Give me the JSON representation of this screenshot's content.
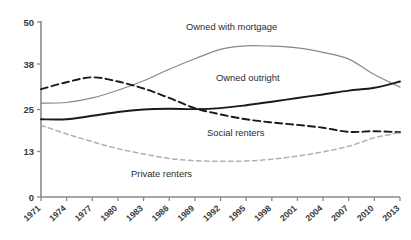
{
  "chart_data": {
    "type": "line",
    "title": "",
    "subtitle": "",
    "xlabel": "",
    "ylabel": "",
    "grid": false,
    "legend_position": "inline-annotations",
    "xlim": [
      1971,
      2013
    ],
    "ylim": [
      0,
      50
    ],
    "ytick_labels": [
      "0",
      "13",
      "25",
      "38",
      "50"
    ],
    "ytick_values": [
      0,
      13,
      25,
      38,
      50
    ],
    "xtick_labels": [
      "1971",
      "1974",
      "1977",
      "1980",
      "1983",
      "1986",
      "1989",
      "1992",
      "1995",
      "1998",
      "2001",
      "2004",
      "2007",
      "2010",
      "2013"
    ],
    "xtick_values": [
      1971,
      1974,
      1977,
      1980,
      1983,
      1986,
      1989,
      1992,
      1995,
      1998,
      2001,
      2004,
      2007,
      2010,
      2013
    ],
    "x": [
      1971,
      1974,
      1977,
      1980,
      1983,
      1986,
      1989,
      1992,
      1995,
      1998,
      2001,
      2004,
      2007,
      2010,
      2013
    ],
    "series": [
      {
        "name": "Owned with mortgage",
        "label": "Owned with mortgage",
        "color": "#888888",
        "style": "solid",
        "width": 1.2,
        "values": [
          26.8,
          27.0,
          28.3,
          30.5,
          33.2,
          36.5,
          39.5,
          42.2,
          43.2,
          43.1,
          42.6,
          41.3,
          39.4,
          35.0,
          31.4
        ]
      },
      {
        "name": "Owned outright",
        "label": "Owned outright",
        "color": "#1a1a1a",
        "style": "solid",
        "width": 1.9,
        "values": [
          22.2,
          22.2,
          23.2,
          24.3,
          25.0,
          25.2,
          25.1,
          25.4,
          26.2,
          27.2,
          28.3,
          29.3,
          30.4,
          31.2,
          33.0
        ]
      },
      {
        "name": "Social renters",
        "label": "Social renters",
        "color": "#1a1a1a",
        "style": "dashed",
        "width": 1.9,
        "values": [
          30.8,
          32.8,
          34.2,
          33.0,
          31.0,
          28.3,
          25.4,
          23.6,
          22.2,
          21.3,
          20.6,
          19.8,
          18.6,
          18.8,
          18.5
        ]
      },
      {
        "name": "Private renters",
        "label": "Private renters",
        "color": "#b0b0b0",
        "style": "dashed-fine",
        "width": 1.5,
        "values": [
          20.5,
          18.0,
          15.8,
          13.8,
          12.3,
          11.0,
          10.4,
          10.2,
          10.3,
          10.8,
          11.7,
          12.9,
          14.5,
          16.9,
          18.4
        ]
      }
    ],
    "annotations": [
      {
        "name": "owned-with-mortgage-label",
        "text": "Owned with mortgage",
        "x": 186,
        "y": 30
      },
      {
        "name": "owned-outright-label",
        "text": "Owned outright",
        "x": 216,
        "y": 81
      },
      {
        "name": "social-renters-label",
        "text": "Social renters",
        "x": 207,
        "y": 136
      },
      {
        "name": "private-renters-label",
        "text": "Private renters",
        "x": 131,
        "y": 177
      }
    ]
  }
}
